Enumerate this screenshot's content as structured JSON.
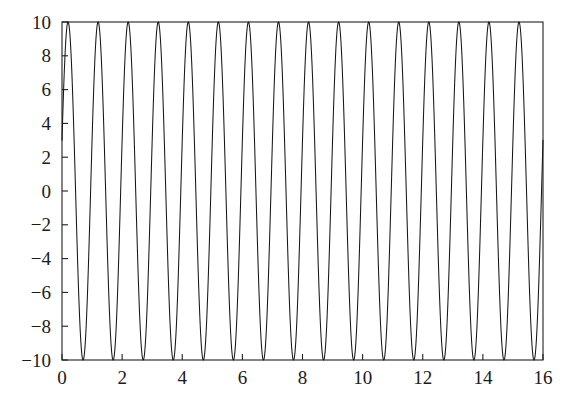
{
  "chart_data": {
    "type": "line",
    "title": "",
    "subtitle": "",
    "xlabel": "",
    "ylabel": "",
    "xlim": [
      0,
      16
    ],
    "ylim": [
      -10,
      10
    ],
    "grid": false,
    "legend": null,
    "legend_position": "none",
    "x_ticks": [
      0,
      2,
      4,
      6,
      8,
      10,
      12,
      14,
      16
    ],
    "x_tick_labels": [
      "0",
      "2",
      "4",
      "6",
      "8",
      "10",
      "12",
      "14",
      "16"
    ],
    "y_ticks": [
      -10,
      -8,
      -6,
      -4,
      -2,
      0,
      2,
      4,
      6,
      8,
      10
    ],
    "y_tick_labels": [
      "−10",
      "−8",
      "−6",
      "−4",
      "−2",
      "0",
      "2",
      "4",
      "6",
      "8",
      "10"
    ],
    "series": [
      {
        "name": "oscillation",
        "color": "#161616",
        "line_width": 1.05,
        "form": "sinusoid",
        "amplitude": 10,
        "period": 1.0,
        "frequency_cycles_per_unit": 1.0,
        "angular_frequency": 6.2832,
        "phase_offset_rad": 0.3047,
        "offset": 0,
        "num_cycles_visible": 16,
        "description": "y = 10*sin(2*pi*x + 0.3047)",
        "sample_points_x": [
          0,
          0.2,
          0.45,
          0.7,
          0.95,
          1.2,
          1.45,
          1.7,
          1.95,
          2.2
        ],
        "sample_points_y": [
          3.0,
          9.5,
          -4.6,
          -9.0,
          5.6,
          9.5,
          -4.6,
          -9.0,
          5.6,
          9.5
        ]
      }
    ],
    "axis_box": true,
    "tick_direction": "in",
    "background_color": "#ffffff",
    "axis_color": "#1f1f1f"
  },
  "figure": {
    "caption": "",
    "axes_name": "oscillation-plot"
  }
}
